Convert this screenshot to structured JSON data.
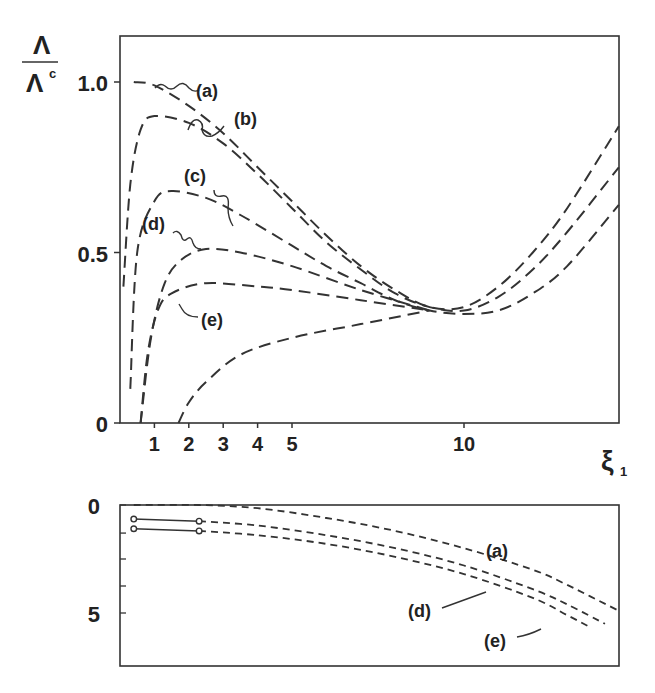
{
  "chart_data": [
    {
      "type": "line",
      "panel": "top",
      "ylabel_num": "Λ",
      "ylabel_den": "Λ",
      "ylabel_den_sup": "c",
      "xlabel": "ξ",
      "xlabel_sub": "1",
      "yticks": [
        "0",
        "0.5",
        "1.0"
      ],
      "xticks": [
        "1",
        "2",
        "3",
        "4",
        "5",
        "10"
      ],
      "ylim": [
        0,
        1.13
      ],
      "xlim": [
        0,
        14.5
      ],
      "grid": false,
      "series": [
        {
          "name": "(a)",
          "x": [
            0.4,
            1,
            2,
            3,
            4,
            5,
            6,
            7,
            8,
            9,
            10,
            11,
            12,
            13,
            14.5
          ],
          "y": [
            1.0,
            0.99,
            0.93,
            0.85,
            0.75,
            0.65,
            0.55,
            0.46,
            0.39,
            0.34,
            0.34,
            0.4,
            0.5,
            0.63,
            0.87
          ]
        },
        {
          "name": "(b)",
          "x": [
            0.1,
            0.3,
            0.6,
            1,
            2,
            3,
            4,
            5,
            6,
            7,
            8,
            9,
            10,
            11,
            12,
            13,
            14.5
          ],
          "y": [
            0.4,
            0.7,
            0.86,
            0.9,
            0.88,
            0.82,
            0.73,
            0.63,
            0.53,
            0.45,
            0.38,
            0.34,
            0.33,
            0.37,
            0.45,
            0.56,
            0.75
          ]
        },
        {
          "name": "(c)",
          "x": [
            0.3,
            0.5,
            1,
            1.5,
            2.5,
            3.5,
            5,
            6,
            7,
            8,
            9,
            10,
            11,
            12,
            13,
            14.5
          ],
          "y": [
            0.1,
            0.5,
            0.65,
            0.68,
            0.66,
            0.61,
            0.52,
            0.46,
            0.41,
            0.36,
            0.33,
            0.32,
            0.33,
            0.38,
            0.46,
            0.64
          ]
        },
        {
          "name": "(d)",
          "x": [
            0.6,
            0.9,
            1.3,
            1.8,
            2.5,
            3.5,
            5,
            7,
            9
          ],
          "y": [
            0.0,
            0.25,
            0.41,
            0.48,
            0.51,
            0.5,
            0.46,
            0.39,
            0.33
          ]
        },
        {
          "name": "(e)",
          "x": [
            0.6,
            0.8,
            1.1,
            1.5,
            2.5,
            4,
            5,
            7,
            9
          ],
          "y": [
            0.0,
            0.2,
            0.33,
            0.38,
            0.41,
            0.4,
            0.39,
            0.36,
            0.33
          ]
        },
        {
          "name": "lower",
          "x": [
            1.7,
            2,
            2.5,
            3.5,
            5,
            7,
            9
          ],
          "y": [
            0.0,
            0.06,
            0.12,
            0.2,
            0.25,
            0.29,
            0.33
          ]
        }
      ],
      "labels": [
        "(a)",
        "(b)",
        "(c)",
        "(d)",
        "(e)"
      ]
    },
    {
      "type": "line",
      "panel": "bottom",
      "yticks": [
        "0",
        "5"
      ],
      "ylim": [
        0,
        6
      ],
      "y_inverted": true,
      "xlim": [
        0,
        14.5
      ],
      "grid": false,
      "series": [
        {
          "name": "(a)",
          "x": [
            0.4,
            2.3,
            4,
            6,
            8,
            10,
            12,
            13,
            14.5
          ],
          "y": [
            0.0,
            0.0,
            0.15,
            0.6,
            1.2,
            2.0,
            3.0,
            3.7,
            4.9
          ]
        },
        {
          "name": "(d)",
          "x": [
            0.4,
            2.3,
            4,
            6,
            8,
            10,
            12,
            13,
            14.1
          ],
          "y": [
            0.65,
            0.75,
            0.95,
            1.4,
            2.0,
            2.8,
            3.9,
            4.6,
            5.5
          ]
        },
        {
          "name": "(e)",
          "x": [
            0.4,
            2.3,
            4,
            6,
            8,
            10,
            12,
            13,
            13.6
          ],
          "y": [
            1.1,
            1.2,
            1.4,
            1.8,
            2.4,
            3.2,
            4.3,
            5.1,
            5.6
          ]
        }
      ],
      "markers": [
        {
          "series": "(d)",
          "x": [
            0.4,
            2.3
          ],
          "solid_segment": true
        },
        {
          "series": "(e)",
          "x": [
            0.4,
            2.3
          ],
          "solid_segment": true
        }
      ],
      "labels": [
        "(a)",
        "(d)",
        "(e)"
      ]
    }
  ]
}
